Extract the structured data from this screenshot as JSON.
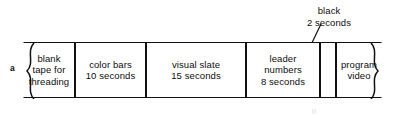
{
  "figure": {
    "panel_label": "a",
    "callout": {
      "line1": "black",
      "line2": "2 seconds"
    },
    "artifact_text": "ll",
    "segments": [
      {
        "name": "blank-tape",
        "lines": [
          "blank",
          "tape for",
          "threading"
        ],
        "left": 0,
        "width": 52,
        "torn_left": true,
        "torn_right": false
      },
      {
        "name": "color-bars",
        "lines": [
          "color bars",
          "10 seconds"
        ],
        "left": 52,
        "width": 71,
        "torn_left": false,
        "torn_right": false
      },
      {
        "name": "visual-slate",
        "lines": [
          "visual slate",
          "15 seconds"
        ],
        "left": 123,
        "width": 100,
        "torn_left": false,
        "torn_right": false
      },
      {
        "name": "leader-numbers",
        "lines": [
          "leader",
          "numbers",
          "8 seconds"
        ],
        "left": 223,
        "width": 74,
        "torn_left": false,
        "torn_right": false
      },
      {
        "name": "black",
        "lines": [],
        "left": 297,
        "width": 16,
        "torn_left": false,
        "torn_right": false
      },
      {
        "name": "program-video",
        "lines": [
          "program",
          "video"
        ],
        "left": 313,
        "width": 46,
        "torn_left": false,
        "torn_right": true
      }
    ],
    "colors": {
      "stroke": "#111111",
      "background": "#ffffff",
      "text": "#0d0d0d"
    }
  }
}
